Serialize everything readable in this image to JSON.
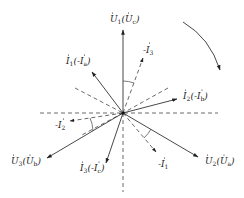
{
  "diagram": {
    "type": "phasor-diagram",
    "center": [
      123,
      113
    ],
    "rotation_arrow": "clockwise",
    "phasors": [
      {
        "id": "U1",
        "main": "U",
        "sub": "1",
        "alt_main": "U",
        "alt_sub": "c",
        "neg": false,
        "alt_neg": false,
        "style": "solid",
        "tip": [
          123,
          30
        ]
      },
      {
        "id": "neg-I3",
        "main": "I",
        "sub": "3",
        "neg": true,
        "style": "dashed",
        "tip": [
          143,
          58
        ]
      },
      {
        "id": "I1",
        "main": "I",
        "sub": "1",
        "alt_main": "I",
        "alt_sub": "a",
        "neg": false,
        "alt_neg": true,
        "style": "solid",
        "tip": [
          92,
          72
        ]
      },
      {
        "id": "I2",
        "main": "I",
        "sub": "2",
        "alt_main": "I",
        "alt_sub": "b",
        "neg": false,
        "alt_neg": true,
        "style": "solid",
        "tip": [
          177,
          99
        ]
      },
      {
        "id": "neg-I2",
        "main": "I",
        "sub": "2",
        "neg": true,
        "style": "dashed",
        "tip": [
          70,
          121
        ]
      },
      {
        "id": "U3",
        "main": "U",
        "sub": "3",
        "alt_main": "U",
        "alt_sub": "b",
        "neg": false,
        "alt_neg": false,
        "style": "solid",
        "tip": [
          47,
          158
        ]
      },
      {
        "id": "I3",
        "main": "I",
        "sub": "3",
        "alt_main": "I",
        "alt_sub": "c",
        "neg": false,
        "alt_neg": true,
        "style": "solid",
        "tip": [
          106,
          163
        ]
      },
      {
        "id": "neg-I1",
        "main": "I",
        "sub": "1",
        "neg": true,
        "style": "dashed",
        "tip": [
          156,
          152
        ]
      },
      {
        "id": "U2",
        "main": "U",
        "sub": "2",
        "alt_main": "U",
        "alt_sub": "a",
        "neg": false,
        "alt_neg": false,
        "style": "solid",
        "tip": [
          198,
          157
        ]
      }
    ],
    "labels": {
      "U1": "U̇₁(U̇c)",
      "neg_I3": "-İ₃",
      "I1": "İ₁(-İa)",
      "I2": "İ₂(-İb)",
      "neg_I2": "-İ₂",
      "U3": "U̇₃(U̇b)",
      "I3": "İ₃(-İc)",
      "neg_I1": "-İ₁",
      "U2": "U̇₂(U̇a)"
    },
    "label_parts": {
      "U1": {
        "a": "U",
        "as": "1",
        "b": "U",
        "bs": "c"
      },
      "I1": {
        "a": "I",
        "as": "1",
        "b": "-I",
        "bs": "a"
      },
      "I2": {
        "a": "I",
        "as": "2",
        "b": "-I",
        "bs": "b"
      },
      "U3": {
        "a": "U",
        "as": "3",
        "b": "U",
        "bs": "b"
      },
      "I3": {
        "a": "I",
        "as": "3",
        "b": "-I",
        "bs": "c"
      },
      "U2": {
        "a": "U",
        "as": "2",
        "b": "U",
        "bs": "a"
      },
      "nI3": {
        "a": "-I",
        "as": "3"
      },
      "nI2": {
        "a": "-I",
        "as": "2"
      },
      "nI1": {
        "a": "-I",
        "as": "1"
      }
    },
    "dot": "·",
    "lparen": "(",
    "rparen": ")"
  }
}
